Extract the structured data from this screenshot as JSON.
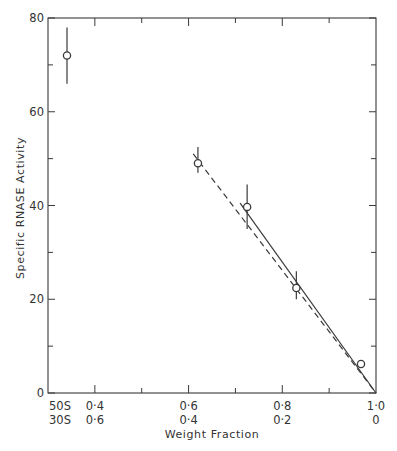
{
  "chart_data": {
    "type": "scatter",
    "title": "",
    "xlabel": "Weight Fraction",
    "ylabel": "Specific RNASE Activity",
    "ylim": [
      0,
      80
    ],
    "xlim": [
      0.3,
      1.0
    ],
    "grid": false,
    "legend": null,
    "y_ticks": [
      {
        "value": 0,
        "label": "0"
      },
      {
        "value": 20,
        "label": "20"
      },
      {
        "value": 40,
        "label": "40"
      },
      {
        "value": 60,
        "label": "60"
      },
      {
        "value": 80,
        "label": "80"
      }
    ],
    "x_ticks": [
      {
        "value": 0.3,
        "top": "50S",
        "bottom": "30S"
      },
      {
        "value": 0.4,
        "top": "0·4",
        "bottom": "0·6"
      },
      {
        "value": 0.6,
        "top": "0·6",
        "bottom": "0·4"
      },
      {
        "value": 0.8,
        "top": "0·8",
        "bottom": "0·2"
      },
      {
        "value": 1.0,
        "top": "1·0",
        "bottom": "0"
      }
    ],
    "x_tick_note": "Dual tick rows: upper row = 50S weight fraction, lower row = 30S weight fraction; leftmost column labelled 50S / 30S",
    "series": [
      {
        "name": "measured points",
        "marker": "open-circle",
        "points": [
          {
            "x": "50S",
            "y": 72,
            "err_low": 66,
            "err_high": 78
          },
          {
            "x": 0.62,
            "y": 49,
            "err_low": 47,
            "err_high": 52.5
          },
          {
            "x": 0.725,
            "y": 39.7,
            "err_low": 35,
            "err_high": 44.5
          },
          {
            "x": 0.83,
            "y": 22.4,
            "err_low": 20,
            "err_high": 26
          },
          {
            "x": 0.968,
            "y": 6.2,
            "err_low": null,
            "err_high": null
          }
        ]
      },
      {
        "name": "dashed fit",
        "style": "dashed",
        "points": [
          {
            "x": 0.61,
            "y": 51
          },
          {
            "x": 1.0,
            "y": 0
          }
        ]
      },
      {
        "name": "solid fit",
        "style": "solid",
        "points": [
          {
            "x": 0.71,
            "y": 40.5
          },
          {
            "x": 1.0,
            "y": 0
          }
        ]
      }
    ]
  }
}
